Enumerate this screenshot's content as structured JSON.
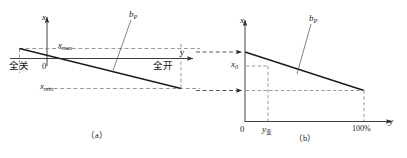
{
  "figure": {
    "panels": [
      {
        "id": "a",
        "caption": "（a）",
        "axis_x_label": "x",
        "axis_y_label": "y",
        "origin_label": "0",
        "curve_label_main": "b",
        "curve_label_sub": "P",
        "labels": {
          "x_max_main": "x",
          "x_max_sub": "max",
          "x_min_main": "x",
          "x_min_sub": "min",
          "left_state": "全关",
          "right_state": "全开"
        }
      },
      {
        "id": "b",
        "caption": "（b）",
        "axis_x_label": "x",
        "axis_y_label": "y",
        "origin_label": "0",
        "curve_label_main": "b",
        "curve_label_sub": "P",
        "labels": {
          "x0_main": "x",
          "x0_sub": "0",
          "y_var_main": "y",
          "y_var_sub": "变",
          "full_scale": "100%"
        }
      }
    ],
    "colors": {
      "stroke": "#2b2b2b",
      "dashed": "#6d6d6d",
      "text": "#141414",
      "background": "#ffffff"
    }
  }
}
